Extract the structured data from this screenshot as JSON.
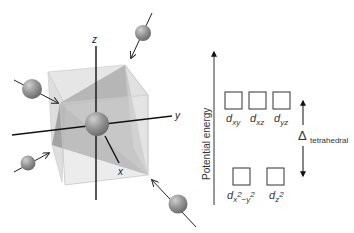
{
  "figure": {
    "type": "tetrahedral crystal field splitting",
    "axes": {
      "x_label": "x",
      "y_label": "y",
      "z_label": "z"
    },
    "energy_axis_label": "Potential energy",
    "upper_orbitals": [
      {
        "main": "d",
        "sub": "xy"
      },
      {
        "main": "d",
        "sub": "xz"
      },
      {
        "main": "d",
        "sub": "yz"
      }
    ],
    "lower_orbitals": [
      {
        "main": "d",
        "sub": "x",
        "sup1": "2",
        "sub2": "−y",
        "sup2": "2"
      },
      {
        "main": "d",
        "sub": "z",
        "sup1": "2"
      }
    ],
    "splitting": {
      "symbol": "Δ",
      "subscript": "tetrahedral"
    },
    "ligand_count": 4,
    "colors": {
      "cube_face": "#d8d8d8",
      "tetra_face": "#9a9a9a",
      "sphere": "#8e8e8e",
      "line": "#222222"
    }
  }
}
